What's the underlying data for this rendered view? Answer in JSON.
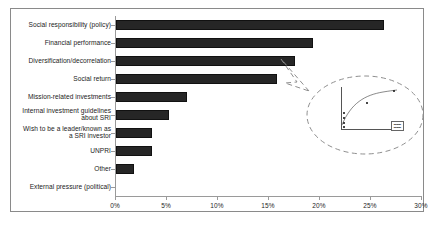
{
  "figure": {
    "background_color": "#ffffff",
    "border_color": "#8a8a8a",
    "bar_color": "#262626",
    "axis_color": "#9a9a9a"
  },
  "chart_data": {
    "type": "bar",
    "orientation": "horizontal",
    "title": "",
    "xlabel": "",
    "ylabel": "",
    "xlim": [
      0,
      30
    ],
    "xtick_labels": [
      "0%",
      "5%",
      "10%",
      "15%",
      "20%",
      "25%",
      "30%"
    ],
    "xtick_values": [
      0,
      5,
      10,
      15,
      20,
      25,
      30
    ],
    "grid": false,
    "legend": "none",
    "categories": [
      "Social responsibility  (policy)",
      "Financial performance",
      "Diversification/decorrelation",
      "Social return",
      "Mission-related investments",
      "Internal investment guidelines\nabout SRI",
      "Wish to be a leader/known as\na SRI investor",
      "UNPRI",
      "Other",
      "External pressure  (political)"
    ],
    "values": [
      26.3,
      19.3,
      17.5,
      15.8,
      7.0,
      5.2,
      3.5,
      3.5,
      1.8,
      0.0
    ]
  },
  "inset": {
    "type": "callout-bubble",
    "shape": "dashed-ellipse-with-pointer",
    "contains": "miniature-line-chart",
    "labels": {
      "note": "inset text is rendered too small to be legible"
    }
  }
}
